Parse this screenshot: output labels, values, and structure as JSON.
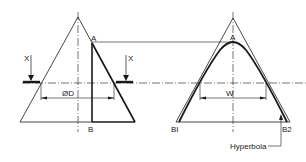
{
  "diagram": {
    "left_view": {
      "labels": {
        "point_a": "A",
        "point_b": "B",
        "section_marker_left": "X",
        "section_marker_right": "X",
        "diameter": "ØD"
      }
    },
    "right_view": {
      "labels": {
        "point_a": "A",
        "point_b1": "BI",
        "point_b2": "B2",
        "width": "W",
        "curve_callout": "Hyperbola"
      }
    },
    "colors": {
      "line": "#1a1a1a",
      "background": "#ffffff"
    }
  }
}
